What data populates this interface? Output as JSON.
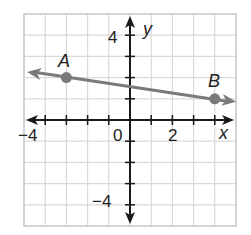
{
  "chart_data": {
    "type": "line",
    "title": "",
    "xlabel": "x",
    "ylabel": "y",
    "xlim": [
      -5,
      5
    ],
    "ylim": [
      -5,
      5
    ],
    "grid": true,
    "tick_labels": {
      "x": [
        {
          "value": -4,
          "label": "−4"
        },
        {
          "value": 0,
          "label": "0"
        },
        {
          "value": 2,
          "label": "2"
        }
      ],
      "y": [
        {
          "value": 4,
          "label": "4"
        },
        {
          "value": -4,
          "label": "−4"
        }
      ]
    },
    "series": [
      {
        "name": "line AB",
        "kind": "line-through-points",
        "arrows_both_ends": true,
        "points": [
          {
            "label": "A",
            "x": -3,
            "y": 2
          },
          {
            "label": "B",
            "x": 4,
            "y": 1
          }
        ],
        "slope": -0.142857,
        "color": "#7a7a7a"
      }
    ]
  },
  "labels": {
    "x_axis": "x",
    "y_axis": "y",
    "x_neg4": "−4",
    "x_0": "0",
    "x_2": "2",
    "y_4": "4",
    "y_neg4": "−4",
    "point_a": "A",
    "point_b": "B"
  },
  "colors": {
    "grid": "#d9d9d9",
    "axis": "#1a1a1a",
    "line": "#7a7a7a",
    "point": "#7a7a7a",
    "frame": "#cccccc"
  }
}
